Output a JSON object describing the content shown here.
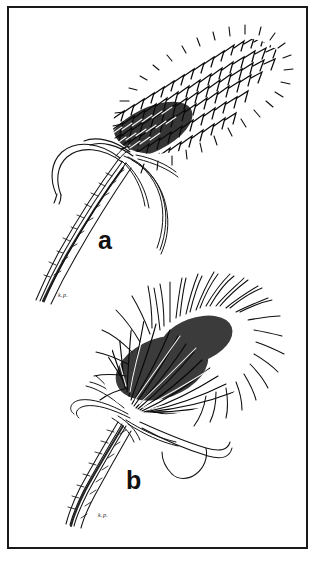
{
  "plate": {
    "kind": "botanical-line-drawing-plate",
    "background_color": "#ffffff",
    "ink_color": "#111111",
    "frame": {
      "border_color": "#1a1a1a",
      "border_width_px": 2,
      "x": 7,
      "y": 6,
      "width": 301,
      "height": 543
    }
  },
  "figures": [
    {
      "id": "a",
      "label": "a",
      "subject": "grass-seed-head-spike-dense-bristly",
      "orientation": "diagonal-lower-left-to-upper-right",
      "signature": "k.p.",
      "label_x": 98,
      "label_y": 228
    },
    {
      "id": "b",
      "label": "b",
      "subject": "grass-seed-head-spike-long-awned-bristly",
      "orientation": "diagonal-lower-left-to-upper-right",
      "signature": "k.p.",
      "label_x": 126,
      "label_y": 468
    }
  ]
}
